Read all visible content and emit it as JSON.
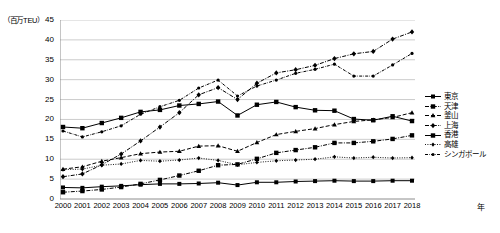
{
  "chart_data": {
    "type": "line",
    "title": "",
    "xlabel": "年",
    "ylabel": "（百万TEU）",
    "ylim": [
      0,
      45
    ],
    "yticks": [
      0,
      5,
      10,
      15,
      20,
      25,
      30,
      35,
      40,
      45
    ],
    "grid": true,
    "legend_position": "right",
    "categories": [
      "2000",
      "2001",
      "2002",
      "2003",
      "2004",
      "2005",
      "2006",
      "2007",
      "2008",
      "2009",
      "2010",
      "2011",
      "2012",
      "2013",
      "2014",
      "2015",
      "2016",
      "2017",
      "2018"
    ],
    "series": [
      {
        "name": "東京",
        "style": "solid-square",
        "values": [
          2.9,
          2.8,
          3.1,
          3.3,
          3.6,
          3.8,
          3.8,
          3.9,
          4.1,
          3.5,
          4.2,
          4.2,
          4.4,
          4.5,
          4.6,
          4.5,
          4.5,
          4.6,
          4.6
        ]
      },
      {
        "name": "天津",
        "style": "dashdot-square",
        "values": [
          1.7,
          2.0,
          2.4,
          3.0,
          3.8,
          4.8,
          5.9,
          7.1,
          8.5,
          8.7,
          10.1,
          11.6,
          12.3,
          13.0,
          14.1,
          14.1,
          14.5,
          15.1,
          16.0
        ]
      },
      {
        "name": "釜山",
        "style": "dashed-triangle",
        "values": [
          7.5,
          8.1,
          9.5,
          10.4,
          11.4,
          11.8,
          12.0,
          13.3,
          13.4,
          12.0,
          14.2,
          16.2,
          17.0,
          17.7,
          18.7,
          19.5,
          19.9,
          20.5,
          21.7
        ]
      },
      {
        "name": "上海",
        "style": "dashdot-diamond",
        "values": [
          5.6,
          6.3,
          8.6,
          11.3,
          14.6,
          18.1,
          21.7,
          26.2,
          28.0,
          25.0,
          29.1,
          31.7,
          32.5,
          33.6,
          35.3,
          36.5,
          37.1,
          40.2,
          42.0
        ]
      },
      {
        "name": "香港",
        "style": "solid-square-line",
        "values": [
          18.1,
          17.8,
          19.1,
          20.4,
          21.9,
          22.4,
          23.5,
          23.9,
          24.5,
          21.0,
          23.7,
          24.4,
          23.1,
          22.3,
          22.2,
          20.1,
          19.8,
          20.8,
          19.6
        ]
      },
      {
        "name": "高雄",
        "style": "dotted-diamond",
        "values": [
          7.4,
          7.5,
          8.5,
          8.8,
          9.7,
          9.5,
          9.8,
          10.3,
          9.7,
          8.6,
          9.2,
          9.6,
          9.8,
          10.0,
          10.6,
          10.3,
          10.5,
          10.3,
          10.4
        ]
      },
      {
        "name": "シンガポール",
        "style": "dashdot-dot",
        "values": [
          17.1,
          15.6,
          16.9,
          18.4,
          21.3,
          23.2,
          24.8,
          27.9,
          29.9,
          25.9,
          28.4,
          29.9,
          31.6,
          32.6,
          33.9,
          30.9,
          30.9,
          33.7,
          36.6
        ]
      }
    ]
  },
  "axis": {
    "y_unit_label": "（百万TEU）",
    "x_title": "年",
    "y_tick_labels": [
      "45",
      "40",
      "35",
      "30",
      "25",
      "20",
      "15",
      "10",
      "5",
      "0"
    ],
    "x_tick_labels": [
      "2000",
      "2001",
      "2002",
      "2003",
      "2004",
      "2005",
      "2006",
      "2007",
      "2008",
      "2009",
      "2010",
      "2011",
      "2012",
      "2013",
      "2014",
      "2015",
      "2016",
      "2017",
      "2018"
    ]
  },
  "legend": {
    "items": [
      {
        "label": "東京"
      },
      {
        "label": "天津"
      },
      {
        "label": "釜山"
      },
      {
        "label": "上海"
      },
      {
        "label": "香港"
      },
      {
        "label": "高雄"
      },
      {
        "label": "シンガポール"
      }
    ]
  },
  "colors": {
    "line": "#000000",
    "grid": "#bfbfbf",
    "axis": "#808080",
    "background": "#ffffff"
  }
}
